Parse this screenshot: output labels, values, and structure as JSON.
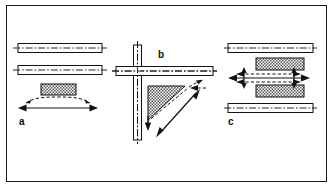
{
  "figure": {
    "border_color": "#1a1a1a",
    "background": "#ffffff",
    "line_color": "#111111",
    "width": 333,
    "height": 187
  },
  "panels": [
    {
      "id": "a",
      "label": "a",
      "description": "Two horizontal bars with centerlines, a stippled weld block, a dashed curved distortion arrow and a solid straight double-headed dimension arrow",
      "elements": {
        "bar_count": 2,
        "block_count": 1,
        "solid_arrows": 1,
        "dashed_arrows": 1,
        "block_fill": "stipple"
      }
    },
    {
      "id": "b",
      "label": "b",
      "description": "Cross shaped joint of a vertical and a horizontal bar with centerlines, a stippled triangular gusset weld, a dashed angled arrow and a solid diagonal double-headed arrow",
      "elements": {
        "bar_count": 2,
        "block_count": 1,
        "solid_arrows": 1,
        "dashed_arrows": 2,
        "block_fill": "stipple"
      }
    },
    {
      "id": "c",
      "label": "c",
      "description": "Two horizontal bars with centerlines enclosing two stippled weld blocks, a solid horizontal double-headed arrow with dashed arrows above and below and small vertical arrows",
      "elements": {
        "bar_count": 3,
        "block_count": 2,
        "solid_arrows": 1,
        "dashed_arrows": 2,
        "block_fill": "stipple"
      }
    }
  ],
  "legend": {
    "solid_line_meaning": "original dimension",
    "dashed_line_meaning": "distorted position"
  }
}
